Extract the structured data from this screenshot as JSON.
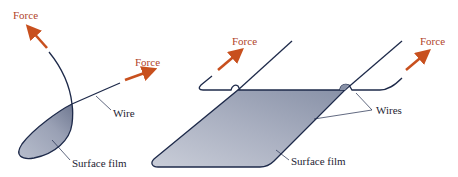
{
  "colors": {
    "force_arrow": "#c8501e",
    "force_text": "#b0442a",
    "wire": "#1e2a4a",
    "film_fill_light": "#d6dae3",
    "film_fill_dark": "#8f97ab",
    "label_text": "#1e2433"
  },
  "left_figure": {
    "force_top_label": "Force",
    "force_right_label": "Force",
    "wire_label": "Wire",
    "film_label": "Surface film"
  },
  "right_figure": {
    "force_left_label": "Force",
    "force_right_label": "Force",
    "wires_label": "Wires",
    "film_label": "Surface film"
  }
}
